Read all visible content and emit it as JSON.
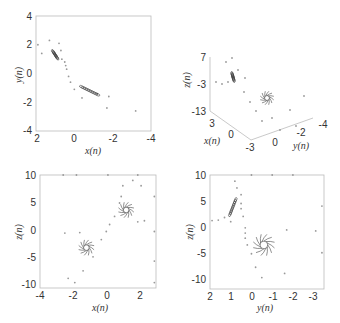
{
  "chart_data": [
    {
      "id": "xy",
      "type": "scatter",
      "title": "",
      "xlabel": "x(n)",
      "ylabel": "y(n)",
      "xlim": [
        2,
        -4
      ],
      "ylim": [
        -4,
        4
      ],
      "xticks": [
        "2",
        "0",
        "-2",
        "-4"
      ],
      "yticks": [
        "4",
        "2",
        "0",
        "-2",
        "-4"
      ],
      "grid": false,
      "frame": {
        "x": 36,
        "y": 16,
        "w": 115,
        "h": 115
      },
      "attractors": [
        {
          "x": 1.0,
          "y": 1.3,
          "shape": "elongated"
        },
        {
          "x": -0.8,
          "y": -1.2,
          "shape": "elongated"
        }
      ],
      "scatter_points": [
        [
          1.3,
          2.3
        ],
        [
          0.8,
          2.1
        ],
        [
          1.7,
          1.4
        ],
        [
          1.9,
          2.0
        ],
        [
          0.7,
          1.6
        ],
        [
          0.5,
          0.8
        ],
        [
          0.4,
          0.3
        ],
        [
          0.3,
          -0.2
        ],
        [
          0.2,
          -0.6
        ],
        [
          0.0,
          -1.1
        ],
        [
          -0.4,
          -1.7
        ],
        [
          -1.2,
          -1.4
        ],
        [
          -1.8,
          -1.6
        ],
        [
          -1.7,
          -2.4
        ],
        [
          -3.2,
          -2.6
        ],
        [
          0.65,
          1.0
        ],
        [
          0.45,
          0.55
        ]
      ]
    },
    {
      "id": "xyz",
      "type": "scatter3d",
      "title": "",
      "xlabel": "x(n)",
      "ylabel": "y(n)",
      "zlabel": "z(n)",
      "xticks": [
        "3",
        "0",
        "-3"
      ],
      "yticks": [
        "0",
        "-2",
        "-4"
      ],
      "zticks": [
        "7",
        "-3",
        "-13"
      ],
      "grid": false,
      "attractors": [
        {
          "px": 233,
          "py": 77,
          "shape": "elongated"
        },
        {
          "px": 267,
          "py": 98,
          "shape": "spiral"
        }
      ]
    },
    {
      "id": "xz",
      "type": "scatter",
      "title": "",
      "xlabel": "x(n)",
      "ylabel": "z(n)",
      "xlim": [
        -4,
        3
      ],
      "ylim": [
        -11,
        10
      ],
      "xticks": [
        "-4",
        "-2",
        "0",
        "2"
      ],
      "yticks": [
        "10",
        "5",
        "0",
        "-5",
        "-10"
      ],
      "grid": false,
      "frame": {
        "x": 40,
        "y": 175,
        "w": 116,
        "h": 113
      },
      "attractors": [
        {
          "x": 1.2,
          "y": 3.5,
          "shape": "spiral"
        },
        {
          "x": -1.2,
          "y": -3.5,
          "shape": "spiral"
        }
      ],
      "scatter_points": [
        [
          -2.5,
          -0.8
        ],
        [
          -1.6,
          -0.7
        ],
        [
          -0.8,
          -5.2
        ],
        [
          -0.3,
          -2.0
        ],
        [
          0.0,
          -0.5
        ],
        [
          0.2,
          0.8
        ],
        [
          0.5,
          2.3
        ],
        [
          0.8,
          4.8
        ],
        [
          0.9,
          6.0
        ],
        [
          1.0,
          8.0
        ],
        [
          1.6,
          9.0
        ],
        [
          2.1,
          8.0
        ],
        [
          2.3,
          1.5
        ],
        [
          1.9,
          1.3
        ],
        [
          2.9,
          6.0
        ],
        [
          2.9,
          -0.5
        ],
        [
          -2.3,
          -9.2
        ],
        [
          -1.4,
          -7.8
        ],
        [
          -1.9,
          -10
        ],
        [
          -2.6,
          10
        ],
        [
          -1.8,
          10
        ],
        [
          0.1,
          10
        ],
        [
          1.9,
          10
        ],
        [
          2.9,
          -6
        ],
        [
          2.9,
          -10
        ]
      ]
    },
    {
      "id": "yz",
      "type": "scatter",
      "title": "",
      "xlabel": "y(n)",
      "ylabel": "z(n)",
      "xlim": [
        2,
        -3.5
      ],
      "ylim": [
        -12,
        10
      ],
      "xticks": [
        "2",
        "1",
        "0",
        "-1",
        "-2",
        "-3"
      ],
      "yticks": [
        "10",
        "5",
        "0",
        "-5",
        "-10"
      ],
      "grid": false,
      "frame": {
        "x": 210,
        "y": 175,
        "w": 114,
        "h": 114
      },
      "attractors": [
        {
          "x": 0.9,
          "y": 3.8,
          "shape": "elongated"
        },
        {
          "x": -0.6,
          "y": -3.5,
          "shape": "spiral"
        }
      ],
      "scatter_points": [
        [
          0.8,
          8.8
        ],
        [
          0.7,
          7.5
        ],
        [
          0.5,
          6.2
        ],
        [
          0.5,
          4.5
        ],
        [
          0.5,
          3.5
        ],
        [
          0.4,
          2.0
        ],
        [
          0.3,
          -0.2
        ],
        [
          0.3,
          -1.2
        ],
        [
          0.3,
          -2.2
        ],
        [
          0.2,
          -3.5
        ],
        [
          0.0,
          -5.2
        ],
        [
          -0.2,
          -7.8
        ],
        [
          -0.5,
          -9.8
        ],
        [
          -1.6,
          -9.0
        ],
        [
          -1.7,
          -0.6
        ],
        [
          -3.1,
          -0.8
        ],
        [
          1.3,
          1.8
        ],
        [
          1.6,
          1.3
        ],
        [
          1.9,
          1.2
        ],
        [
          1.0,
          1.0
        ],
        [
          -2.0,
          10
        ],
        [
          -1.0,
          10
        ],
        [
          0.0,
          10
        ],
        [
          -3.4,
          -5
        ],
        [
          -3.4,
          4
        ]
      ]
    }
  ],
  "caption": {
    "visible_text": "",
    "note": "caption line cut off at image bottom"
  }
}
